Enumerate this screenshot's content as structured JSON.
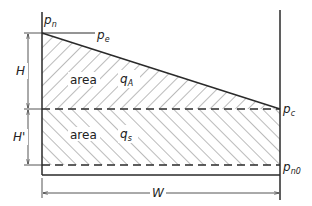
{
  "labels": {
    "pn": "p",
    "pn_sub": "n",
    "pe": "p",
    "pe_sub": "e",
    "pc": "p",
    "pc_sub": "c",
    "pn0": "p",
    "pn0_sub": "n0",
    "H": "H",
    "H_prime": "H'",
    "W": "W",
    "area_upper": "area",
    "qA": "q",
    "qA_sub": "A",
    "area_lower": "area",
    "qs": "q",
    "qs_sub": "s"
  },
  "colors": {
    "line": "#2a2a2a",
    "hatch": "#555555",
    "background": "#ffffff"
  }
}
